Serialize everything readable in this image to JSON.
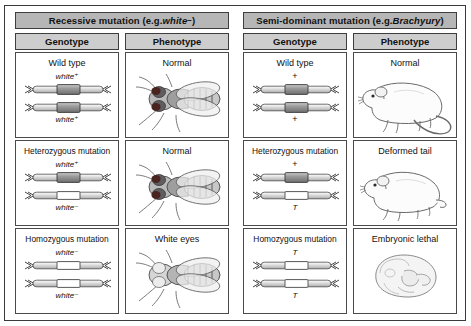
{
  "figure": {
    "title_recessive_prefix": "Recessive mutation (e.g. ",
    "title_recessive_gene": "white",
    "title_recessive_sign": "−",
    "title_recessive_suffix": ")",
    "title_semidominant_prefix": "Semi-dominant mutation (e.g. ",
    "title_semidominant_gene": "Brachyury",
    "title_semidominant_suffix": ")"
  },
  "columns": {
    "genotype": "Genotype",
    "phenotype": "Phenotype"
  },
  "left_panel": {
    "header": "Recessive mutation (e.g. white−)",
    "organism": "fruit-fly",
    "rows": [
      {
        "genotype_title": "Wild type",
        "allele_top": "white⁺",
        "allele_bottom": "white⁺",
        "phenotype_title": "Normal",
        "eye_color": "#4a2420"
      },
      {
        "genotype_title": "Heterozygous mutation",
        "allele_top": "white⁺",
        "allele_bottom": "white⁻",
        "phenotype_title": "Normal",
        "eye_color": "#4a2420"
      },
      {
        "genotype_title": "Homozygous mutation",
        "allele_top": "white⁻",
        "allele_bottom": "white⁻",
        "phenotype_title": "White eyes",
        "eye_color": "#e8e8e8"
      }
    ]
  },
  "right_panel": {
    "header": "Semi-dominant mutation (e.g. Brachyury)",
    "organism": "mouse",
    "rows": [
      {
        "genotype_title": "Wild type",
        "allele_top": "+",
        "allele_bottom": "+",
        "phenotype_title": "Normal"
      },
      {
        "genotype_title": "Heterozygous mutation",
        "allele_top": "+",
        "allele_bottom": "T",
        "phenotype_title": "Deformed tail"
      },
      {
        "genotype_title": "Homozygous mutation",
        "allele_top": "T",
        "allele_bottom": "T",
        "phenotype_title": "Embryonic lethal"
      }
    ]
  },
  "colors": {
    "header_band": "#b6b6b6",
    "column_band": "#cdcdcd",
    "border": "#3e3e3e",
    "gene_box": "#8f8f8f",
    "chromosome_arm": "#d8d8d8",
    "page_background": "#ffffff"
  }
}
